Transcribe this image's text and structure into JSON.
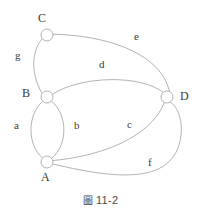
{
  "figure": {
    "caption_symbol": "圖",
    "caption_number": "11-2",
    "caption_full": "圖 11-2",
    "line_color": "#a9a9a9",
    "text_color": "#3a3a3a",
    "background_color": "#ffffff"
  },
  "graph": {
    "type": "multigraph",
    "vertices": [
      {
        "id": "C",
        "label": "C",
        "cx": 47,
        "cy": 35,
        "r": 6,
        "label_x": 38,
        "label_y": 12
      },
      {
        "id": "B",
        "label": "B",
        "cx": 47,
        "cy": 97,
        "r": 6,
        "label_x": 22,
        "label_y": 87
      },
      {
        "id": "A",
        "label": "A",
        "cx": 47,
        "cy": 162,
        "r": 6,
        "label_x": 41,
        "label_y": 171
      },
      {
        "id": "D",
        "label": "D",
        "cx": 167,
        "cy": 97,
        "r": 6,
        "label_x": 180,
        "label_y": 90
      }
    ],
    "edges": [
      {
        "id": "a",
        "label": "a",
        "from": "A",
        "to": "B",
        "label_x": 14,
        "label_y": 120
      },
      {
        "id": "b",
        "label": "b",
        "from": "A",
        "to": "B",
        "label_x": 74,
        "label_y": 120
      },
      {
        "id": "c",
        "label": "c",
        "from": "A",
        "to": "D",
        "label_x": 127,
        "label_y": 119
      },
      {
        "id": "d",
        "label": "d",
        "from": "B",
        "to": "D",
        "label_x": 99,
        "label_y": 59
      },
      {
        "id": "e",
        "label": "e",
        "from": "C",
        "to": "D",
        "label_x": 134,
        "label_y": 31
      },
      {
        "id": "f",
        "label": "f",
        "from": "A",
        "to": "D",
        "label_x": 148,
        "label_y": 157
      },
      {
        "id": "g",
        "label": "g",
        "from": "C",
        "to": "B",
        "label_x": 15,
        "label_y": 50
      }
    ]
  }
}
